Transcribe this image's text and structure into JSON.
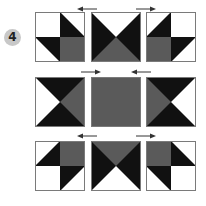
{
  "step_badge": "4",
  "colors": {
    "black": "#111111",
    "gray": "#5a5a5a",
    "white": "#ffffff",
    "border": "#7a7a7a",
    "arrow": "#333333"
  },
  "rows": [
    {
      "tiles": [
        {
          "name": "tile-r1-c1",
          "pattern": "quad-pinwheel-a"
        },
        {
          "name": "tile-r1-c2",
          "pattern": "hourglass-vertical-white-top-gray-bottom"
        },
        {
          "name": "tile-r1-c3",
          "pattern": "quad-pinwheel-a-mirrored"
        }
      ],
      "arrows": [
        {
          "direction": "left"
        },
        {
          "direction": "right"
        }
      ]
    },
    {
      "tiles": [
        {
          "name": "tile-r2-c1",
          "pattern": "hourglass-horizontal-white-left-gray-right"
        },
        {
          "name": "tile-r2-c2",
          "pattern": "solid-gray"
        },
        {
          "name": "tile-r2-c3",
          "pattern": "hourglass-horizontal-gray-left-white-right"
        }
      ],
      "arrows": [
        {
          "direction": "right"
        },
        {
          "direction": "left"
        }
      ]
    },
    {
      "tiles": [
        {
          "name": "tile-r3-c1",
          "pattern": "quad-pinwheel-b"
        },
        {
          "name": "tile-r3-c2",
          "pattern": "hourglass-vertical-gray-top-white-bottom"
        },
        {
          "name": "tile-r3-c3",
          "pattern": "quad-pinwheel-b-mirrored"
        }
      ],
      "arrows": [
        {
          "direction": "left"
        },
        {
          "direction": "right"
        }
      ]
    }
  ]
}
